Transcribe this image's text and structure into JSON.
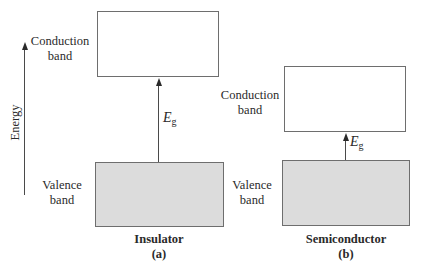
{
  "axis": {
    "label": "Energy"
  },
  "panels": [
    {
      "id": "a",
      "material": "Insulator",
      "sublabel": "(a)",
      "conduction_label_line1": "Conduction",
      "conduction_label_line2": "band",
      "valence_label_line1": "Valence",
      "valence_label_line2": "band",
      "gap_symbol": "E",
      "gap_subscript": "g",
      "gap_size": "large"
    },
    {
      "id": "b",
      "material": "Semiconductor",
      "sublabel": "(b)",
      "conduction_label_line1": "Conduction",
      "conduction_label_line2": "band",
      "valence_label_line1": "Valence",
      "valence_label_line2": "band",
      "gap_symbol": "E",
      "gap_subscript": "g",
      "gap_size": "small"
    }
  ],
  "colors": {
    "valence_fill": "#dcdcdc",
    "conduction_fill": "#ffffff",
    "border": "#6e6e6e"
  }
}
